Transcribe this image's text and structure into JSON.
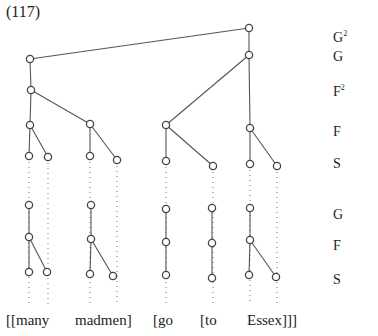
{
  "example_number": "(117)",
  "level_labels": [
    {
      "base": "G",
      "sup": "2",
      "y": 34
    },
    {
      "base": "G",
      "sup": "",
      "y": 57
    },
    {
      "base": "F",
      "sup": "2",
      "y": 88
    },
    {
      "base": "F",
      "sup": "",
      "y": 132
    },
    {
      "base": "S",
      "sup": "",
      "y": 164
    },
    {
      "base": "G",
      "sup": "",
      "y": 215
    },
    {
      "base": "F",
      "sup": "",
      "y": 246
    },
    {
      "base": "S",
      "sup": "",
      "y": 280
    }
  ],
  "words": [
    {
      "text": "[[many",
      "x": 6
    },
    {
      "text": "madmen]",
      "x": 75
    },
    {
      "text": "[go",
      "x": 153
    },
    {
      "text": "[to",
      "x": 200
    },
    {
      "text": "Essex]]]",
      "x": 247
    }
  ],
  "nodes": [
    {
      "id": "root",
      "x": 249,
      "y": 28
    },
    {
      "id": "g",
      "x": 249,
      "y": 55
    },
    {
      "id": "l1",
      "x": 30,
      "y": 59
    },
    {
      "id": "l2",
      "x": 31,
      "y": 90
    },
    {
      "id": "many_f",
      "x": 30,
      "y": 125
    },
    {
      "id": "madmen_f",
      "x": 90,
      "y": 124
    },
    {
      "id": "many_s1",
      "x": 29,
      "y": 156
    },
    {
      "id": "many_s2",
      "x": 48,
      "y": 157
    },
    {
      "id": "madmen_s1",
      "x": 90,
      "y": 156
    },
    {
      "id": "madmen_s2",
      "x": 117,
      "y": 160
    },
    {
      "id": "go_f",
      "x": 166,
      "y": 125
    },
    {
      "id": "go_s",
      "x": 166,
      "y": 161
    },
    {
      "id": "to_s",
      "x": 213,
      "y": 166
    },
    {
      "id": "essex_f",
      "x": 250,
      "y": 128
    },
    {
      "id": "essex_s1",
      "x": 250,
      "y": 164
    },
    {
      "id": "essex_s2",
      "x": 277,
      "y": 166
    },
    {
      "id": "many_g2",
      "x": 29,
      "y": 205
    },
    {
      "id": "many_f2",
      "x": 29,
      "y": 237
    },
    {
      "id": "many_s3",
      "x": 29,
      "y": 272
    },
    {
      "id": "many_s4",
      "x": 47,
      "y": 272
    },
    {
      "id": "madmen_g2",
      "x": 91,
      "y": 205
    },
    {
      "id": "madmen_f2",
      "x": 91,
      "y": 239
    },
    {
      "id": "madmen_s3",
      "x": 90,
      "y": 274
    },
    {
      "id": "madmen_s4",
      "x": 113,
      "y": 276
    },
    {
      "id": "go_g2",
      "x": 166,
      "y": 209
    },
    {
      "id": "go_f2",
      "x": 166,
      "y": 242
    },
    {
      "id": "go_s2",
      "x": 166,
      "y": 275
    },
    {
      "id": "to_g2",
      "x": 212,
      "y": 208
    },
    {
      "id": "to_f2",
      "x": 212,
      "y": 243
    },
    {
      "id": "to_s2",
      "x": 212,
      "y": 278
    },
    {
      "id": "essex_g2",
      "x": 250,
      "y": 208
    },
    {
      "id": "essex_f2",
      "x": 250,
      "y": 240
    },
    {
      "id": "essex_s3",
      "x": 249,
      "y": 275
    },
    {
      "id": "essex_s4",
      "x": 276,
      "y": 277
    }
  ],
  "edges": [
    [
      "root",
      "l1"
    ],
    [
      "root",
      "g"
    ],
    [
      "l1",
      "l2"
    ],
    [
      "l2",
      "many_f"
    ],
    [
      "l2",
      "madmen_f"
    ],
    [
      "many_f",
      "many_s1"
    ],
    [
      "many_f",
      "many_s2"
    ],
    [
      "madmen_f",
      "madmen_s1"
    ],
    [
      "madmen_f",
      "madmen_s2"
    ],
    [
      "g",
      "go_f"
    ],
    [
      "g",
      "essex_f"
    ],
    [
      "go_f",
      "go_s"
    ],
    [
      "go_f",
      "to_s"
    ],
    [
      "essex_f",
      "essex_s1"
    ],
    [
      "essex_f",
      "essex_s2"
    ],
    [
      "many_g2",
      "many_f2"
    ],
    [
      "many_f2",
      "many_s3"
    ],
    [
      "many_f2",
      "many_s4"
    ],
    [
      "madmen_g2",
      "madmen_f2"
    ],
    [
      "madmen_f2",
      "madmen_s3"
    ],
    [
      "madmen_f2",
      "madmen_s4"
    ],
    [
      "go_g2",
      "go_f2"
    ],
    [
      "go_f2",
      "go_s2"
    ],
    [
      "to_g2",
      "to_f2"
    ],
    [
      "to_f2",
      "to_s2"
    ],
    [
      "essex_g2",
      "essex_f2"
    ],
    [
      "essex_f2",
      "essex_s3"
    ],
    [
      "essex_f2",
      "essex_s4"
    ]
  ],
  "dotted_lines": [
    {
      "x": 29,
      "y1": 162,
      "y2": 305
    },
    {
      "x": 48,
      "y1": 163,
      "y2": 305
    },
    {
      "x": 90,
      "y1": 162,
      "y2": 305
    },
    {
      "x": 117,
      "y1": 166,
      "y2": 305
    },
    {
      "x": 166,
      "y1": 167,
      "y2": 305
    },
    {
      "x": 213,
      "y1": 172,
      "y2": 305
    },
    {
      "x": 250,
      "y1": 170,
      "y2": 305
    },
    {
      "x": 277,
      "y1": 172,
      "y2": 305
    }
  ],
  "colors": {
    "line": "#555555",
    "node_stroke": "#444444",
    "dots": "#777777"
  }
}
